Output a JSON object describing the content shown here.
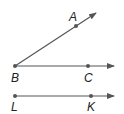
{
  "diagram": {
    "type": "geometry-rays",
    "colors": {
      "line": "#555555",
      "point": "#555555",
      "label": "#222222"
    },
    "rays": [
      {
        "name": "ray-BA",
        "from": "B",
        "through": "A"
      },
      {
        "name": "ray-BC",
        "from": "B",
        "through": "C"
      },
      {
        "name": "ray-LK",
        "from": "L",
        "through": "K"
      }
    ],
    "points": [
      {
        "id": "A",
        "label": "A"
      },
      {
        "id": "B",
        "label": "B"
      },
      {
        "id": "C",
        "label": "C"
      },
      {
        "id": "L",
        "label": "L"
      },
      {
        "id": "K",
        "label": "K"
      }
    ]
  }
}
